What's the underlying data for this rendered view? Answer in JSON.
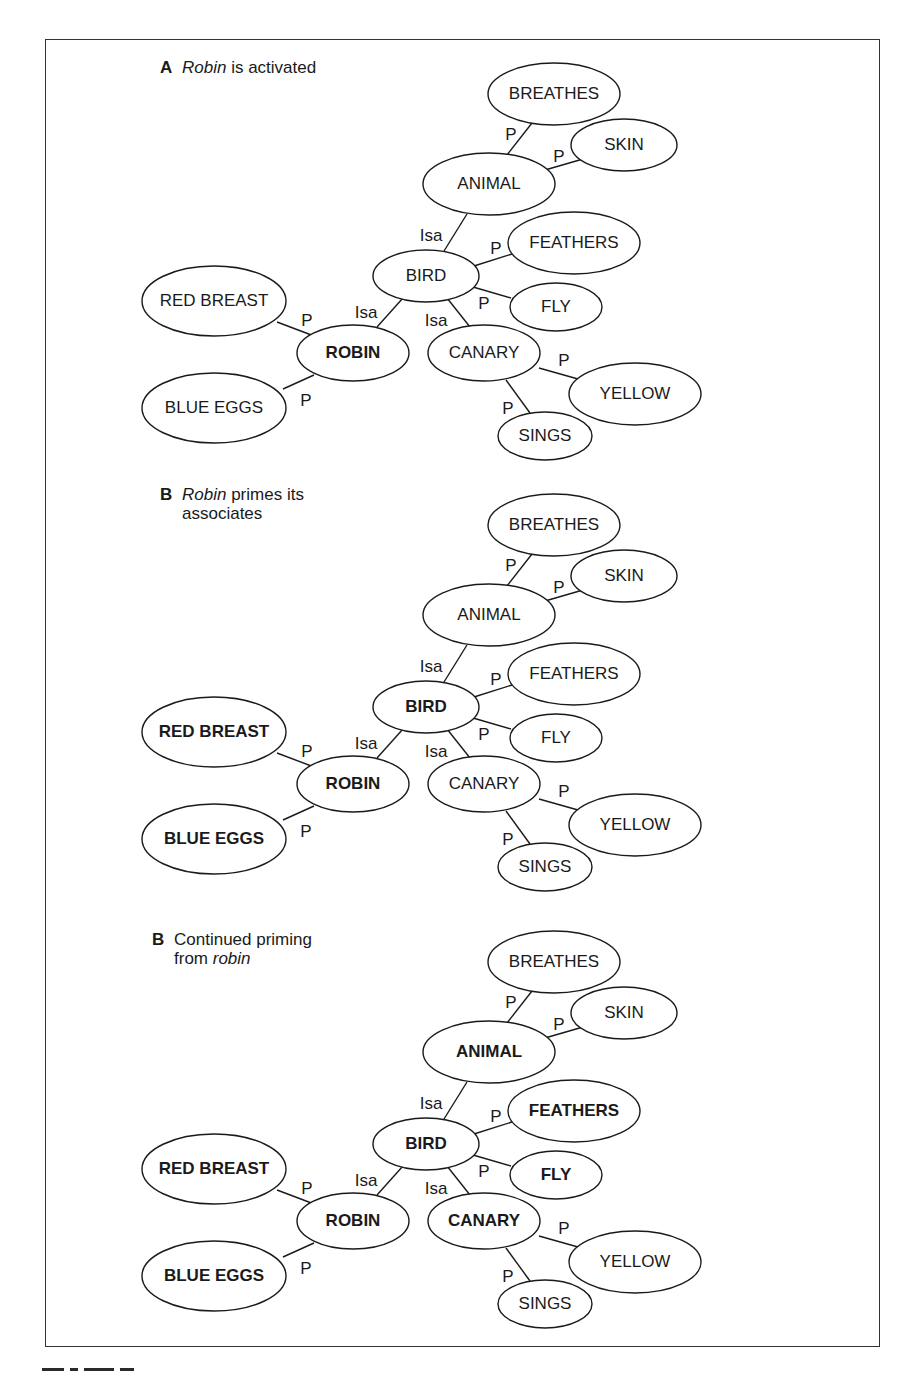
{
  "colors": {
    "ink": "#1a1a1a",
    "frame": "#333333",
    "background": "#ffffff"
  },
  "panels": [
    {
      "id": "A",
      "letter": "A",
      "title_parts": [
        {
          "text": "Robin",
          "italic": true
        },
        {
          "text": " is activated",
          "italic": false
        }
      ],
      "title_line2_parts": [],
      "title_pos": {
        "x": 160,
        "y": 58
      },
      "offset_y": 0,
      "bold_nodes": [
        "ROBIN"
      ]
    },
    {
      "id": "B1",
      "letter": "B",
      "title_parts": [
        {
          "text": "Robin",
          "italic": true
        },
        {
          "text": " primes its",
          "italic": false
        }
      ],
      "title_line2_parts": [
        {
          "text": "associates",
          "italic": false
        }
      ],
      "title_pos": {
        "x": 160,
        "y": 485
      },
      "offset_y": 431,
      "bold_nodes": [
        "ROBIN",
        "RED BREAST",
        "BLUE EGGS",
        "BIRD"
      ]
    },
    {
      "id": "B2",
      "letter": "B",
      "title_parts": [
        {
          "text": "Continued priming",
          "italic": false
        }
      ],
      "title_line2_parts": [
        {
          "text": "from ",
          "italic": false
        },
        {
          "text": "robin",
          "italic": true
        }
      ],
      "title_pos": {
        "x": 152,
        "y": 930
      },
      "offset_y": 868,
      "bold_nodes": [
        "ROBIN",
        "RED BREAST",
        "BLUE EGGS",
        "BIRD",
        "ANIMAL",
        "FEATHERS",
        "FLY",
        "CANARY"
      ]
    }
  ],
  "nodes": [
    {
      "id": "BREATHES",
      "label": "BREATHES",
      "cx": 554,
      "cy": 94,
      "rx": 66,
      "ry": 31
    },
    {
      "id": "SKIN",
      "label": "SKIN",
      "cx": 624,
      "cy": 145,
      "rx": 53,
      "ry": 26
    },
    {
      "id": "ANIMAL",
      "label": "ANIMAL",
      "cx": 489,
      "cy": 184,
      "rx": 66,
      "ry": 31
    },
    {
      "id": "FEATHERS",
      "label": "FEATHERS",
      "cx": 574,
      "cy": 243,
      "rx": 66,
      "ry": 31
    },
    {
      "id": "BIRD",
      "label": "BIRD",
      "cx": 426,
      "cy": 276,
      "rx": 53,
      "ry": 26
    },
    {
      "id": "FLY",
      "label": "FLY",
      "cx": 556,
      "cy": 307,
      "rx": 46,
      "ry": 24
    },
    {
      "id": "RED BREAST",
      "label": "RED BREAST",
      "cx": 214,
      "cy": 301,
      "rx": 72,
      "ry": 35
    },
    {
      "id": "ROBIN",
      "label": "ROBIN",
      "cx": 353,
      "cy": 353,
      "rx": 56,
      "ry": 28
    },
    {
      "id": "CANARY",
      "label": "CANARY",
      "cx": 484,
      "cy": 353,
      "rx": 56,
      "ry": 28
    },
    {
      "id": "YELLOW",
      "label": "YELLOW",
      "cx": 635,
      "cy": 394,
      "rx": 66,
      "ry": 31
    },
    {
      "id": "BLUE EGGS",
      "label": "BLUE EGGS",
      "cx": 214,
      "cy": 408,
      "rx": 72,
      "ry": 35
    },
    {
      "id": "SINGS",
      "label": "SINGS",
      "cx": 545,
      "cy": 436,
      "rx": 47,
      "ry": 24
    }
  ],
  "edges": [
    {
      "from": "ANIMAL",
      "to": "BREATHES",
      "label": "P",
      "x1": 507,
      "y1": 155,
      "x2": 532,
      "y2": 123,
      "lx": 511,
      "ly": 136
    },
    {
      "from": "ANIMAL",
      "to": "SKIN",
      "label": "P",
      "x1": 545,
      "y1": 170,
      "x2": 583,
      "y2": 159,
      "lx": 559,
      "ly": 158
    },
    {
      "from": "BIRD",
      "to": "ANIMAL",
      "label": "Isa",
      "x1": 444,
      "y1": 251,
      "x2": 467,
      "y2": 214,
      "lx": 431,
      "ly": 237
    },
    {
      "from": "BIRD",
      "to": "FEATHERS",
      "label": "P",
      "x1": 474,
      "y1": 266,
      "x2": 512,
      "y2": 254,
      "lx": 496,
      "ly": 250
    },
    {
      "from": "BIRD",
      "to": "FLY",
      "label": "P",
      "x1": 473,
      "y1": 287,
      "x2": 511,
      "y2": 298,
      "lx": 484,
      "ly": 305
    },
    {
      "from": "ROBIN",
      "to": "BIRD",
      "label": "Isa",
      "x1": 377,
      "y1": 327,
      "x2": 403,
      "y2": 298,
      "lx": 366,
      "ly": 314
    },
    {
      "from": "BIRD",
      "to": "CANARY",
      "label": "Isa",
      "x1": 447,
      "y1": 298,
      "x2": 470,
      "y2": 327,
      "lx": 436,
      "ly": 322
    },
    {
      "from": "RED BREAST",
      "to": "ROBIN",
      "label": "P",
      "x1": 277,
      "y1": 322,
      "x2": 314,
      "y2": 336,
      "lx": 307,
      "ly": 322
    },
    {
      "from": "ROBIN",
      "to": "BLUE EGGS",
      "label": "P",
      "x1": 314,
      "y1": 375,
      "x2": 283,
      "y2": 389,
      "lx": 306,
      "ly": 402
    },
    {
      "from": "CANARY",
      "to": "YELLOW",
      "label": "P",
      "x1": 539,
      "y1": 368,
      "x2": 578,
      "y2": 379,
      "lx": 564,
      "ly": 362
    },
    {
      "from": "CANARY",
      "to": "SINGS",
      "label": "P",
      "x1": 506,
      "y1": 380,
      "x2": 530,
      "y2": 413,
      "lx": 508,
      "ly": 410
    }
  ],
  "figure_caption": ""
}
